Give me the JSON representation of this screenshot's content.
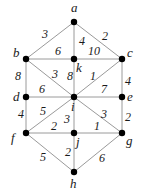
{
  "graph": {
    "nodes": [
      {
        "id": "a",
        "label": "a",
        "x": 74,
        "y": 22,
        "lx": 71,
        "ly": 12
      },
      {
        "id": "b",
        "label": "b",
        "x": 26,
        "y": 59,
        "lx": 13,
        "ly": 57
      },
      {
        "id": "k",
        "label": "k",
        "x": 74,
        "y": 59,
        "lx": 76,
        "ly": 72
      },
      {
        "id": "c",
        "label": "c",
        "x": 122,
        "y": 59,
        "lx": 127,
        "ly": 57
      },
      {
        "id": "d",
        "label": "d",
        "x": 26,
        "y": 97,
        "lx": 13,
        "ly": 101
      },
      {
        "id": "i",
        "label": "i",
        "x": 74,
        "y": 97,
        "lx": 71,
        "ly": 111
      },
      {
        "id": "e",
        "label": "e",
        "x": 122,
        "y": 97,
        "lx": 127,
        "ly": 101
      },
      {
        "id": "f",
        "label": "f",
        "x": 26,
        "y": 133,
        "lx": 11,
        "ly": 142
      },
      {
        "id": "j",
        "label": "j",
        "x": 74,
        "y": 133,
        "lx": 76,
        "ly": 146
      },
      {
        "id": "g",
        "label": "g",
        "x": 122,
        "y": 133,
        "lx": 126,
        "ly": 145
      },
      {
        "id": "h",
        "label": "h",
        "x": 74,
        "y": 172,
        "lx": 70,
        "ly": 188
      }
    ],
    "edges": [
      {
        "from": "a",
        "to": "b",
        "weight": "3",
        "wx": 42,
        "wy": 38
      },
      {
        "from": "a",
        "to": "k",
        "weight": "4",
        "wx": 79,
        "wy": 45
      },
      {
        "from": "a",
        "to": "c",
        "weight": "2",
        "wx": 102,
        "wy": 40
      },
      {
        "from": "b",
        "to": "k",
        "weight": "6",
        "wx": 55,
        "wy": 55
      },
      {
        "from": "k",
        "to": "c",
        "weight": "10",
        "wx": 88,
        "wy": 55
      },
      {
        "from": "b",
        "to": "d",
        "weight": "8",
        "wx": 15,
        "wy": 80
      },
      {
        "from": "b",
        "to": "i",
        "weight": "3",
        "wx": 52,
        "wy": 78
      },
      {
        "from": "k",
        "to": "i",
        "weight": "8",
        "wx": 67,
        "wy": 80
      },
      {
        "from": "c",
        "to": "i",
        "weight": "1",
        "wx": 90,
        "wy": 80
      },
      {
        "from": "c",
        "to": "e",
        "weight": "4",
        "wx": 125,
        "wy": 85
      },
      {
        "from": "d",
        "to": "i",
        "weight": "6",
        "wx": 39,
        "wy": 93
      },
      {
        "from": "i",
        "to": "e",
        "weight": "7",
        "wx": 101,
        "wy": 93
      },
      {
        "from": "d",
        "to": "f",
        "weight": "4",
        "wx": 18,
        "wy": 118
      },
      {
        "from": "f",
        "to": "i",
        "weight": "5",
        "wx": 40,
        "wy": 115
      },
      {
        "from": "i",
        "to": "j",
        "weight": "3",
        "wx": 64,
        "wy": 123
      },
      {
        "from": "i",
        "to": "g",
        "weight": "3",
        "wx": 101,
        "wy": 118
      },
      {
        "from": "e",
        "to": "g",
        "weight": "2",
        "wx": 125,
        "wy": 121
      },
      {
        "from": "f",
        "to": "j",
        "weight": "2",
        "wx": 51,
        "wy": 130
      },
      {
        "from": "j",
        "to": "g",
        "weight": "1",
        "wx": 94,
        "wy": 130
      },
      {
        "from": "f",
        "to": "h",
        "weight": "5",
        "wx": 40,
        "wy": 161
      },
      {
        "from": "j",
        "to": "h",
        "weight": "2",
        "wx": 65,
        "wy": 156
      },
      {
        "from": "g",
        "to": "h",
        "weight": "6",
        "wx": 99,
        "wy": 162
      }
    ]
  },
  "colors": {
    "edge": "#9a9a9a",
    "node": "#000000",
    "text": "#1a1a1a",
    "background": "#ffffff"
  }
}
